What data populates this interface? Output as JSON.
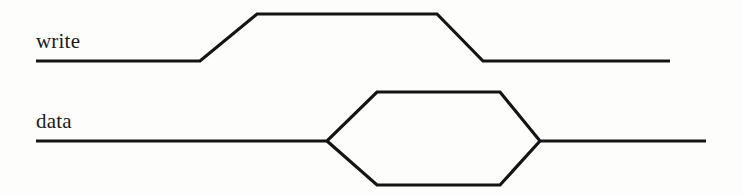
{
  "figure": {
    "type": "timing-diagram",
    "width": 742,
    "height": 195,
    "background_color": "#fdfdfc",
    "line_color": "#141414",
    "text_color": "#1a1a1a",
    "line_width": 3.2
  },
  "signals": [
    {
      "name": "write",
      "label": "write",
      "kind": "logic-level",
      "label_position": {
        "x": 36,
        "y": 31
      },
      "low_level_y": 61,
      "high_level_y": 14,
      "start_x": 36,
      "end_x": 670,
      "transitions": [
        {
          "type": "rise-start",
          "x": 200
        },
        {
          "type": "rise-end",
          "x": 257
        },
        {
          "type": "fall-start",
          "x": 437
        },
        {
          "type": "fall-end",
          "x": 483
        }
      ],
      "path": "M 36 61 L 200 61 L 257 14 L 437 14 L 483 61 L 670 61"
    },
    {
      "name": "data",
      "label": "data",
      "kind": "bus-valid",
      "label_position": {
        "x": 36,
        "y": 111
      },
      "mid_level_y": 141,
      "high_level_y": 92,
      "low_level_y": 185,
      "start_x": 36,
      "end_x": 706,
      "transitions": [
        {
          "type": "valid-start",
          "x": 327
        },
        {
          "type": "valid-top-left",
          "x": 377
        },
        {
          "type": "valid-top-right",
          "x": 500
        },
        {
          "type": "valid-end",
          "x": 540
        }
      ],
      "path_top": "M 36 141 L 327 141 L 377 92 L 500 92 L 540 141 L 706 141",
      "path_bottom": "M 327 141 L 377 185 L 500 185 L 540 141"
    }
  ],
  "chart_data": {
    "type": "line",
    "xlabel": "",
    "ylabel": "",
    "grid": false,
    "legend": "none",
    "x_range": [
      0,
      742
    ],
    "y_range": [
      0,
      195
    ],
    "series": [
      {
        "name": "write",
        "points": [
          [
            36,
            61
          ],
          [
            200,
            61
          ],
          [
            257,
            14
          ],
          [
            437,
            14
          ],
          [
            483,
            61
          ],
          [
            670,
            61
          ]
        ]
      },
      {
        "name": "data-upper",
        "points": [
          [
            36,
            141
          ],
          [
            327,
            141
          ],
          [
            377,
            92
          ],
          [
            500,
            92
          ],
          [
            540,
            141
          ],
          [
            706,
            141
          ]
        ]
      },
      {
        "name": "data-lower",
        "points": [
          [
            327,
            141
          ],
          [
            377,
            185
          ],
          [
            500,
            185
          ],
          [
            540,
            141
          ]
        ]
      }
    ]
  }
}
